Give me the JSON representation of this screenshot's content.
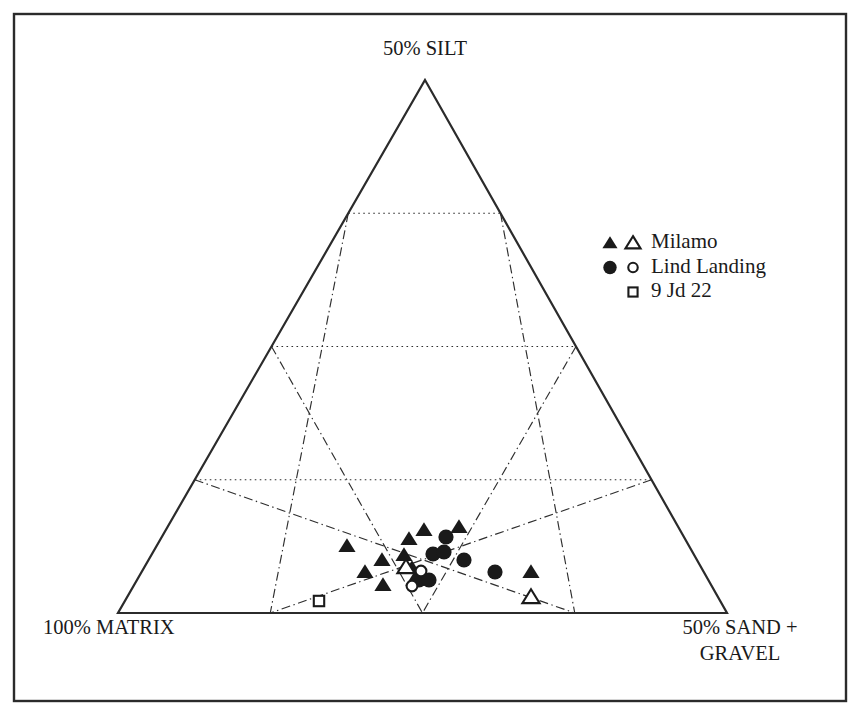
{
  "figure": {
    "type": "ternary-scatter-diagram",
    "background_color": "#ffffff",
    "ink_color": "#1a1a1a",
    "frame": {
      "x": 14,
      "y": 14,
      "width": 832,
      "height": 687
    }
  },
  "axis_labels": {
    "top": "50% SILT",
    "bottom_left": "100% MATRIX",
    "bottom_right_line1": "50% SAND +",
    "bottom_right_line2": "GRAVEL"
  },
  "legend": {
    "entries": [
      {
        "label": "Milamo",
        "markers": [
          "filled-triangle",
          "open-triangle"
        ]
      },
      {
        "label": "Lind Landing",
        "markers": [
          "filled-circle",
          "open-circle"
        ]
      },
      {
        "label": "9 Jd 22",
        "markers": [
          "open-square"
        ]
      }
    ]
  },
  "chart_data": {
    "type": "scatter",
    "title": "",
    "subtitle": "",
    "xlabel": "",
    "ylabel": "",
    "grid": true,
    "legend_position": "right",
    "ternary": {
      "apex_label": "50% SILT",
      "left_label": "100% MATRIX",
      "right_label": "50% SAND + GRAVEL",
      "subdivisions": 4,
      "apex_px": [
        425,
        80
      ],
      "left_px": [
        118,
        613
      ],
      "right_px": [
        727,
        613
      ]
    },
    "series": [
      {
        "name": "Milamo",
        "marker": "filled-triangle",
        "points_px": [
          [
            347,
            546
          ],
          [
            365,
            572
          ],
          [
            382,
            560
          ],
          [
            383,
            585
          ],
          [
            404,
            555
          ],
          [
            409,
            539
          ],
          [
            412,
            568
          ],
          [
            414,
            580
          ],
          [
            424,
            530
          ],
          [
            459,
            527
          ],
          [
            531,
            572
          ]
        ]
      },
      {
        "name": "Milamo",
        "marker": "open-triangle",
        "points_px": [
          [
            406,
            567
          ],
          [
            531,
            597
          ]
        ]
      },
      {
        "name": "Lind Landing",
        "marker": "filled-circle",
        "points_px": [
          [
            419,
            580
          ],
          [
            429,
            580
          ],
          [
            433,
            554
          ],
          [
            444,
            552
          ],
          [
            446,
            537
          ],
          [
            464,
            560
          ],
          [
            495,
            572
          ]
        ]
      },
      {
        "name": "Lind Landing",
        "marker": "open-circle",
        "points_px": [
          [
            412,
            586
          ],
          [
            421,
            571
          ]
        ]
      },
      {
        "name": "9 Jd 22",
        "marker": "open-square",
        "points_px": [
          [
            319,
            601
          ]
        ]
      }
    ]
  }
}
